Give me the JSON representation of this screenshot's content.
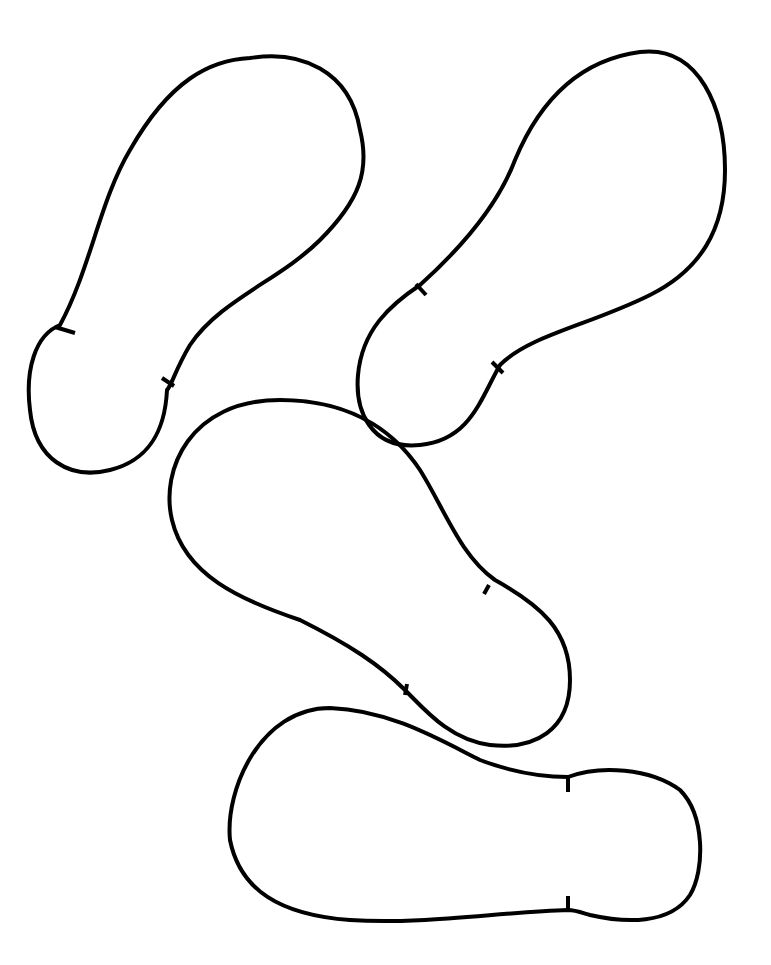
{
  "page": {
    "width": 771,
    "height": 965,
    "background": "#ffffff",
    "stroke_color": "#000000",
    "stroke_width": 4
  },
  "soles": [
    {
      "id": "sole-1",
      "position": "top-left",
      "orientation": "toe up-right, heel down-left",
      "outline": "M 60 325 C 90 270 100 200 130 150 C 170 80 210 60 250 58 C 300 50 350 70 360 130 C 370 170 360 200 320 240 C 280 280 220 300 190 345 C 175 370 172 385 167 390 C 165 430 150 460 110 470 C 70 480 35 460 30 410 C 25 370 35 335 60 325 Z",
      "notches": [
        "M 55 327 L 75 333",
        "M 162 378 L 174 386"
      ]
    },
    {
      "id": "sole-2",
      "position": "top-right",
      "orientation": "toe up-right, heel down-left",
      "outline": "M 420 285 C 470 240 500 200 515 160 C 540 100 580 60 640 52 C 700 45 725 110 725 170 C 725 230 700 270 650 295 C 590 325 530 335 500 365 C 480 400 470 440 420 445 C 370 450 355 410 358 375 C 362 330 390 305 420 285 Z",
      "notches": [
        "M 416 284 L 426 295",
        "M 492 362 L 503 373"
      ]
    },
    {
      "id": "sole-3",
      "position": "middle",
      "orientation": "toe up-left, heel down-right",
      "outline": "M 280 400 C 360 400 400 440 420 470 C 445 510 460 555 495 580 C 540 605 570 630 570 680 C 570 730 535 750 490 745 C 450 740 425 710 405 690 C 380 665 350 645 300 620 C 240 600 185 575 172 520 C 160 470 190 400 280 400 Z",
      "notches": [
        "M 489 585 L 484 594",
        "M 407 684 L 405 695"
      ]
    },
    {
      "id": "sole-4",
      "position": "bottom",
      "orientation": "toe left, heel right",
      "outline": "M 330 708 C 390 710 440 740 480 760 C 520 775 550 777 568 777 C 600 765 650 768 680 790 C 705 815 705 870 690 895 C 670 925 625 923 590 915 C 580 912 575 910 568 910 C 500 912 420 925 350 920 C 280 915 240 890 230 840 C 225 790 260 708 330 708 Z",
      "notches": [
        "M 568 778 L 568 792",
        "M 568 896 L 568 910"
      ]
    }
  ]
}
